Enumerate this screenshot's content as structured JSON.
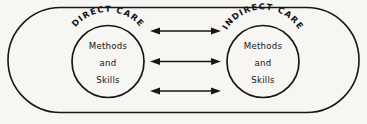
{
  "diagram": {
    "background_color": "#f7f6f3",
    "stroke_color": "#171717",
    "outer_container": {
      "shape": "stadium",
      "label": ""
    },
    "groups": [
      {
        "id": "direct-care",
        "arc_label": "DIRECT CARE",
        "inner_lines": [
          "Methods",
          "and",
          "Skills"
        ]
      },
      {
        "id": "indirect-care",
        "arc_label": "INDIRECT CARE",
        "inner_lines": [
          "Methods",
          "and",
          "Skills"
        ]
      }
    ],
    "connectors": [
      {
        "id": "connector-top",
        "type": "double-headed-arrow"
      },
      {
        "id": "connector-middle",
        "type": "double-headed-arrow"
      },
      {
        "id": "connector-bottom",
        "type": "double-headed-arrow"
      }
    ]
  }
}
